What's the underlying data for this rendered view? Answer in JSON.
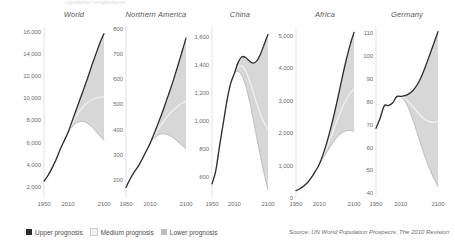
{
  "figure": {
    "top_title": "...opulation projections",
    "source": "Source: UN World Population Prospects: The 2010 Revision"
  },
  "legend": {
    "position": "bottom-left",
    "items": [
      {
        "label": "Upper prognosis",
        "color": "#2b2b2b"
      },
      {
        "label": "Medium prognosis",
        "color": "#f2f2f2"
      },
      {
        "label": "Lower prognosis",
        "color": "#bdbdbd"
      }
    ]
  },
  "chart_data": [
    {
      "type": "line",
      "title": "World",
      "xlabel": "",
      "ylabel": "",
      "unit": "millions",
      "grid": false,
      "xlim": [
        1950,
        2100
      ],
      "ylim": [
        1000,
        16500
      ],
      "xticks": [
        1950,
        2010,
        2100
      ],
      "yticks": [
        2000,
        4000,
        6000,
        8000,
        10000,
        12000,
        14000,
        16000
      ],
      "ytick_labels": [
        "2,000",
        "4,000",
        "6,000",
        "8,000",
        "10,000",
        "12,000",
        "14,000",
        "16,000"
      ],
      "x": [
        1950,
        1960,
        1970,
        1980,
        1990,
        2000,
        2010,
        2020,
        2030,
        2040,
        2050,
        2060,
        2070,
        2080,
        2090,
        2100
      ],
      "series": [
        {
          "name": "Upper prognosis",
          "color": "#2b2b2b",
          "values": [
            2530,
            3030,
            3690,
            4440,
            5320,
            6120,
            6900,
            7900,
            8900,
            9900,
            10900,
            11900,
            13000,
            14000,
            15000,
            15800
          ]
        },
        {
          "name": "Medium prognosis",
          "color": "#f2f2f2",
          "values": [
            2530,
            3030,
            3690,
            4440,
            5320,
            6120,
            6900,
            7650,
            8320,
            8870,
            9300,
            9620,
            9850,
            10000,
            10100,
            10120
          ]
        },
        {
          "name": "Lower prognosis",
          "color": "#bdbdbd",
          "values": [
            2530,
            3030,
            3690,
            4440,
            5320,
            6120,
            6900,
            7400,
            7750,
            7900,
            7900,
            7700,
            7400,
            7000,
            6600,
            6200
          ]
        }
      ]
    },
    {
      "type": "line",
      "title": "Northern America",
      "xlabel": "",
      "ylabel": "",
      "unit": "millions",
      "grid": false,
      "xlim": [
        1950,
        2100
      ],
      "ylim": [
        130,
        810
      ],
      "xticks": [
        1950,
        2010,
        2100
      ],
      "yticks": [
        200,
        300,
        400,
        500,
        600,
        700,
        800
      ],
      "ytick_labels": [
        "200",
        "300",
        "400",
        "500",
        "600",
        "700",
        "800"
      ],
      "x": [
        1950,
        1960,
        1970,
        1980,
        1990,
        2000,
        2010,
        2020,
        2030,
        2040,
        2050,
        2060,
        2070,
        2080,
        2090,
        2100
      ],
      "series": [
        {
          "name": "Upper prognosis",
          "color": "#2b2b2b",
          "values": [
            172,
            204,
            231,
            254,
            282,
            314,
            345,
            383,
            424,
            465,
            510,
            556,
            604,
            655,
            708,
            762
          ]
        },
        {
          "name": "Medium prognosis",
          "color": "#f2f2f2",
          "values": [
            172,
            204,
            231,
            254,
            282,
            314,
            345,
            375,
            402,
            424,
            446,
            464,
            480,
            494,
            505,
            513
          ]
        },
        {
          "name": "Lower prognosis",
          "color": "#bdbdbd",
          "values": [
            172,
            204,
            231,
            254,
            282,
            314,
            345,
            366,
            379,
            384,
            383,
            377,
            366,
            352,
            338,
            325
          ]
        }
      ]
    },
    {
      "type": "line",
      "title": "China",
      "xlabel": "",
      "ylabel": "",
      "unit": "millions",
      "grid": false,
      "xlim": [
        1950,
        2100
      ],
      "ylim": [
        450,
        1680
      ],
      "xticks": [
        1950,
        2010,
        2100
      ],
      "yticks": [
        600,
        800,
        1000,
        1200,
        1400,
        1600
      ],
      "ytick_labels": [
        "600",
        "800",
        "1,000",
        "1,200",
        "1,400",
        "1,600"
      ],
      "x": [
        1950,
        1960,
        1970,
        1980,
        1990,
        2000,
        2010,
        2020,
        2030,
        2040,
        2050,
        2060,
        2070,
        2080,
        2090,
        2100
      ],
      "series": [
        {
          "name": "Upper prognosis",
          "color": "#2b2b2b",
          "values": [
            551,
            644,
            818,
            981,
            1145,
            1270,
            1341,
            1420,
            1460,
            1455,
            1430,
            1415,
            1430,
            1480,
            1550,
            1620
          ]
        },
        {
          "name": "Medium prognosis",
          "color": "#f2f2f2",
          "values": [
            551,
            644,
            818,
            981,
            1145,
            1270,
            1341,
            1387,
            1393,
            1360,
            1296,
            1212,
            1125,
            1048,
            985,
            941
          ]
        },
        {
          "name": "Lower prognosis",
          "color": "#bdbdbd",
          "values": [
            551,
            644,
            818,
            981,
            1145,
            1270,
            1341,
            1355,
            1325,
            1255,
            1150,
            1020,
            880,
            745,
            620,
            510
          ]
        }
      ]
    },
    {
      "type": "line",
      "title": "Africa",
      "xlabel": "",
      "ylabel": "",
      "unit": "millions",
      "grid": false,
      "xlim": [
        1950,
        2100
      ],
      "ylim": [
        0,
        5300
      ],
      "xticks": [
        1950,
        2010,
        2100
      ],
      "yticks": [
        0,
        1000,
        2000,
        3000,
        4000,
        5000
      ],
      "ytick_labels": [
        "0",
        "1,000",
        "2,000",
        "3,000",
        "4,000",
        "5,000"
      ],
      "x": [
        1950,
        1960,
        1970,
        1980,
        1990,
        2000,
        2010,
        2020,
        2030,
        2040,
        2050,
        2060,
        2070,
        2080,
        2090,
        2100
      ],
      "series": [
        {
          "name": "Upper prognosis",
          "color": "#2b2b2b",
          "values": [
            229,
            285,
            366,
            478,
            632,
            819,
            1031,
            1340,
            1720,
            2160,
            2650,
            3180,
            3740,
            4260,
            4720,
            5100
          ]
        },
        {
          "name": "Medium prognosis",
          "color": "#f2f2f2",
          "values": [
            229,
            285,
            366,
            478,
            632,
            819,
            1031,
            1280,
            1560,
            1860,
            2190,
            2500,
            2790,
            3030,
            3220,
            3360
          ]
        },
        {
          "name": "Lower prognosis",
          "color": "#bdbdbd",
          "values": [
            229,
            285,
            366,
            478,
            632,
            819,
            1031,
            1230,
            1420,
            1600,
            1780,
            1920,
            2020,
            2070,
            2080,
            2060
          ]
        }
      ]
    },
    {
      "type": "line",
      "title": "Germany",
      "xlabel": "",
      "ylabel": "",
      "unit": "millions",
      "grid": false,
      "xlim": [
        1950,
        2100
      ],
      "ylim": [
        38,
        113
      ],
      "xticks": [
        1950,
        2010,
        2100
      ],
      "yticks": [
        40,
        50,
        60,
        70,
        80,
        90,
        100,
        110
      ],
      "ytick_labels": [
        "40",
        "50",
        "60",
        "70",
        "80",
        "90",
        "100",
        "110"
      ],
      "x": [
        1950,
        1960,
        1970,
        1980,
        1990,
        2000,
        2010,
        2020,
        2030,
        2040,
        2050,
        2060,
        2070,
        2080,
        2090,
        2100
      ],
      "series": [
        {
          "name": "Upper prognosis",
          "color": "#2b2b2b",
          "values": [
            68.4,
            72.8,
            78.2,
            78.3,
            79.4,
            82.2,
            82.3,
            82.6,
            83.5,
            85.0,
            87.5,
            91.0,
            95.5,
            100.5,
            105.5,
            110.5
          ]
        },
        {
          "name": "Medium prognosis",
          "color": "#f2f2f2",
          "values": [
            68.4,
            72.8,
            78.2,
            78.3,
            79.4,
            82.2,
            82.3,
            81.4,
            79.8,
            77.8,
            75.5,
            73.5,
            72.0,
            71.2,
            71.0,
            71.5
          ]
        },
        {
          "name": "Lower prognosis",
          "color": "#bdbdbd",
          "values": [
            68.4,
            72.8,
            78.2,
            78.3,
            79.4,
            82.2,
            82.3,
            80.2,
            76.6,
            71.8,
            66.2,
            60.5,
            55.2,
            50.5,
            46.5,
            43.0
          ]
        }
      ]
    }
  ]
}
